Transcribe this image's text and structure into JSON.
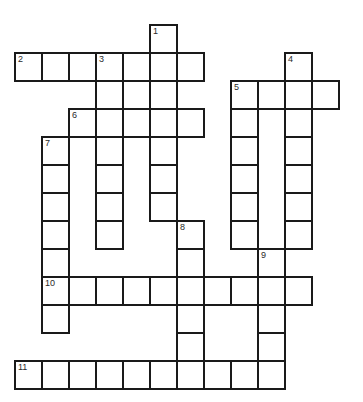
{
  "puzzle": {
    "grid": {
      "origin_x": 14,
      "origin_y": 24,
      "col_step": 27,
      "row_step": 28
    },
    "colors": {
      "line": "#1a1a1a",
      "cell_bg": "#ffffff",
      "number": "#2a2a2a"
    },
    "entries": [
      {
        "number": "1",
        "direction": "down",
        "row": 0,
        "col": 5,
        "length": 7
      },
      {
        "number": "2",
        "direction": "across",
        "row": 1,
        "col": 0,
        "length": 7
      },
      {
        "number": "3",
        "direction": "down",
        "row": 1,
        "col": 3,
        "length": 7
      },
      {
        "number": "4",
        "direction": "down",
        "row": 1,
        "col": 10,
        "length": 7
      },
      {
        "number": "5",
        "direction": "across",
        "row": 2,
        "col": 8,
        "length": 4
      },
      {
        "number": "5",
        "direction": "down",
        "row": 2,
        "col": 8,
        "length": 6
      },
      {
        "number": "6",
        "direction": "across",
        "row": 3,
        "col": 2,
        "length": 5
      },
      {
        "number": "7",
        "direction": "down",
        "row": 4,
        "col": 1,
        "length": 7
      },
      {
        "number": "8",
        "direction": "down",
        "row": 7,
        "col": 6,
        "length": 6
      },
      {
        "number": "9",
        "direction": "down",
        "row": 8,
        "col": 9,
        "length": 5
      },
      {
        "number": "10",
        "direction": "across",
        "row": 9,
        "col": 1,
        "length": 10
      },
      {
        "number": "11",
        "direction": "across",
        "row": 12,
        "col": 0,
        "length": 10
      }
    ],
    "cell_values": {}
  }
}
